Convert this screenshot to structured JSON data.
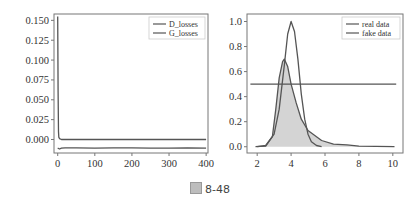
{
  "caption": {
    "icon": "figure-label-icon",
    "text": "8-48"
  },
  "colors": {
    "line": "#555555",
    "fill": "#d4d4d4",
    "frame": "#777777",
    "text": "#333333"
  },
  "chart_data": [
    {
      "type": "line",
      "title": "",
      "xlabel": "",
      "ylabel": "",
      "xlim": [
        -10,
        405
      ],
      "ylim": [
        -0.017,
        0.158
      ],
      "xticks": [
        0,
        100,
        200,
        300,
        400
      ],
      "xtick_labels": [
        "0",
        "100",
        "200",
        "300",
        "400"
      ],
      "yticks": [
        0.0,
        0.025,
        0.05,
        0.075,
        0.1,
        0.125,
        0.15
      ],
      "ytick_labels": [
        "0.000",
        "0.025",
        "0.050",
        "0.075",
        "0.100",
        "0.125",
        "0.150"
      ],
      "legend": {
        "position": "top-right",
        "entries": [
          "D_losses",
          "G_losses"
        ]
      },
      "grid": false,
      "series": [
        {
          "name": "D_losses",
          "x": [
            0,
            1,
            2,
            3,
            5,
            10,
            50,
            100,
            150,
            200,
            250,
            300,
            350,
            400
          ],
          "y": [
            0.155,
            0.06,
            0.01,
            0.003,
            0.001,
            0.0,
            0.0,
            0.0,
            0.0,
            0.0,
            0.0,
            0.0,
            0.0,
            0.0
          ]
        },
        {
          "name": "G_losses",
          "x": [
            0,
            5,
            10,
            20,
            50,
            100,
            150,
            200,
            250,
            300,
            350,
            400
          ],
          "y": [
            -0.011,
            -0.012,
            -0.011,
            -0.0105,
            -0.0105,
            -0.011,
            -0.0105,
            -0.0105,
            -0.011,
            -0.011,
            -0.0105,
            -0.011
          ]
        }
      ]
    },
    {
      "type": "line",
      "title": "",
      "xlabel": "",
      "ylabel": "",
      "xlim": [
        1.4,
        10.6
      ],
      "ylim": [
        -0.05,
        1.06
      ],
      "xticks": [
        2,
        4,
        6,
        8,
        10
      ],
      "xtick_labels": [
        "2",
        "4",
        "6",
        "8",
        "10"
      ],
      "yticks": [
        0.0,
        0.2,
        0.4,
        0.6,
        0.8,
        1.0
      ],
      "ytick_labels": [
        "0.0",
        "0.2",
        "0.4",
        "0.6",
        "0.8",
        "1.0"
      ],
      "legend": {
        "position": "top-right",
        "entries": [
          "real data",
          "fake data"
        ]
      },
      "grid": false,
      "series": [
        {
          "name": "real data",
          "x": [
            2.0,
            2.5,
            3.0,
            3.3,
            3.6,
            3.8,
            4.0,
            4.2,
            4.4,
            4.6,
            4.8,
            5.0,
            5.2,
            5.5,
            5.8
          ],
          "y": [
            0.0,
            0.01,
            0.1,
            0.3,
            0.65,
            0.9,
            1.0,
            0.92,
            0.7,
            0.42,
            0.22,
            0.1,
            0.04,
            0.01,
            0.0
          ]
        },
        {
          "name": "fake data",
          "fill": true,
          "x": [
            1.9,
            2.5,
            2.9,
            3.1,
            3.3,
            3.5,
            3.6,
            3.8,
            4.0,
            4.3,
            4.6,
            5.0,
            5.3,
            5.8,
            6.5,
            7.3,
            8.0,
            9.0,
            10.1
          ],
          "y": [
            0.0,
            0.005,
            0.08,
            0.3,
            0.55,
            0.68,
            0.7,
            0.64,
            0.5,
            0.35,
            0.22,
            0.13,
            0.1,
            0.05,
            0.02,
            0.015,
            0.005,
            0.003,
            0.0
          ]
        },
        {
          "name": "decision boundary",
          "x": [
            1.6,
            10.2
          ],
          "y": [
            0.5,
            0.5
          ]
        }
      ]
    }
  ]
}
